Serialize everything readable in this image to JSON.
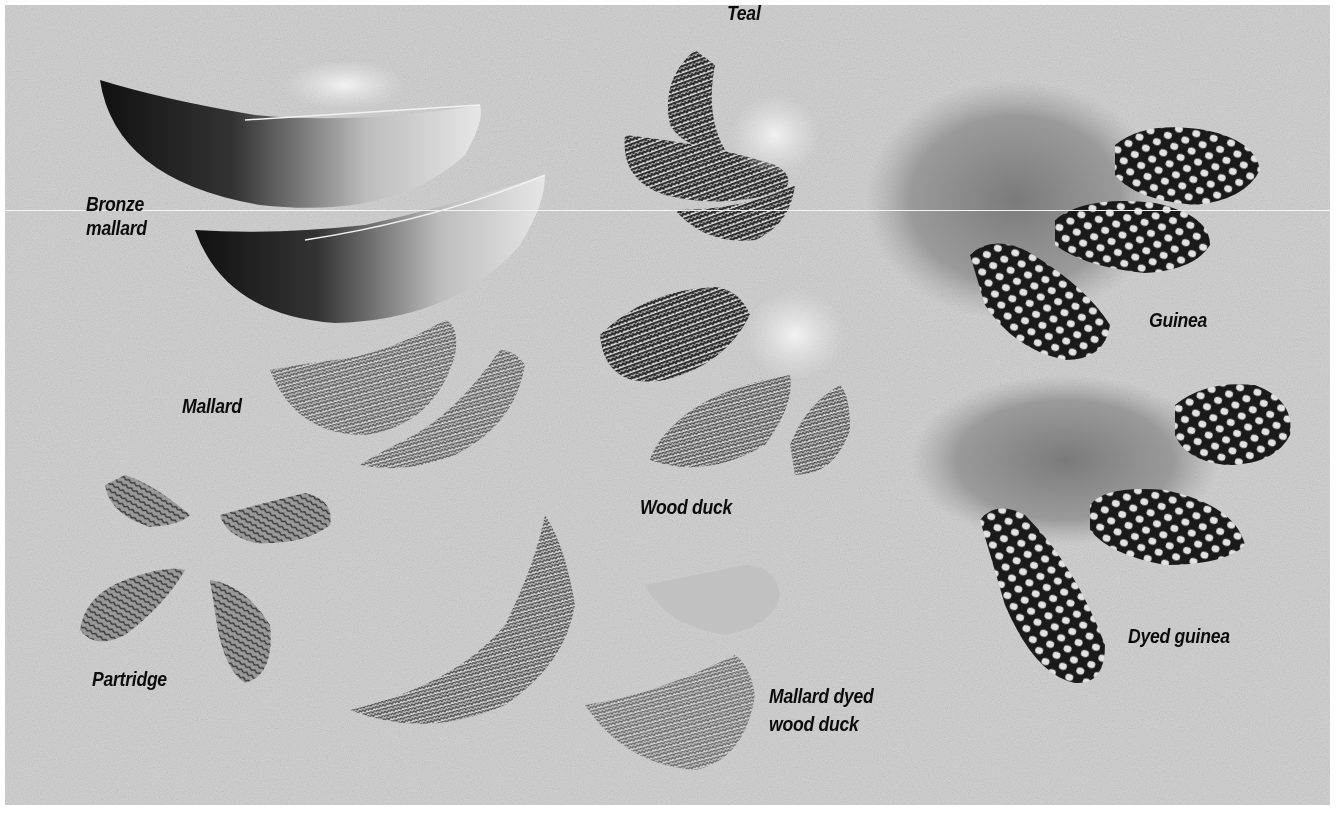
{
  "image": {
    "subject": "Assorted feathers on a gray textured background",
    "background_color": "#d4d4d4",
    "label_color": "#0b0b0b"
  },
  "labels": {
    "bronze_mallard_line1": "Bronze",
    "bronze_mallard_line2": "mallard",
    "teal": "Teal",
    "guinea": "Guinea",
    "mallard": "Mallard",
    "wood_duck": "Wood duck",
    "dyed_guinea": "Dyed guinea",
    "partridge": "Partridge",
    "mallard_dyed_wood_duck_line1": "Mallard dyed",
    "mallard_dyed_wood_duck_line2": "wood duck"
  },
  "feathers": [
    {
      "name": "bronze-mallard",
      "count": 2
    },
    {
      "name": "teal",
      "count": 3
    },
    {
      "name": "guinea",
      "count": 3
    },
    {
      "name": "mallard",
      "count": 2
    },
    {
      "name": "wood-duck",
      "count": 3
    },
    {
      "name": "dyed-guinea",
      "count": 3
    },
    {
      "name": "partridge",
      "count": 4
    },
    {
      "name": "mallard-dyed-wood-duck",
      "count": 3
    }
  ]
}
